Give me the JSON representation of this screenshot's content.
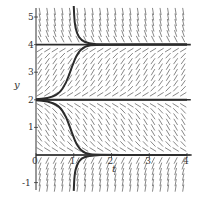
{
  "chart_data": {
    "type": "line",
    "subtype": "slope-field",
    "title": "",
    "xlabel": "t",
    "ylabel": "y",
    "xlim": [
      0,
      4
    ],
    "ylim": [
      -1.3,
      5.4
    ],
    "xticks": [
      "0",
      "1",
      "2",
      "3",
      "4"
    ],
    "yticks": [
      "-1",
      "1",
      "2",
      "3",
      "4",
      "5"
    ],
    "grid": false,
    "legend": null,
    "equilibria": [
      0,
      2,
      4
    ],
    "slope_field": {
      "description": "Direction field: slopes negative (steep) for y>4, positive for 2<y<4, negative for 0<y<2, steep for y<0",
      "t_step": 0.2,
      "y_step": 0.2
    },
    "series": [
      {
        "name": "solution-from-above-4",
        "points": [
          [
            1.0,
            5.4
          ],
          [
            1.02,
            4.8
          ],
          [
            1.08,
            4.4
          ],
          [
            1.2,
            4.15
          ],
          [
            1.4,
            4.04
          ],
          [
            1.7,
            4.0
          ],
          [
            4.0,
            4.0
          ]
        ]
      },
      {
        "name": "solution-2-to-4",
        "points": [
          [
            0.0,
            2.02
          ],
          [
            0.3,
            2.05
          ],
          [
            0.6,
            2.2
          ],
          [
            0.8,
            2.6
          ],
          [
            0.95,
            3.2
          ],
          [
            1.1,
            3.7
          ],
          [
            1.3,
            3.95
          ],
          [
            1.6,
            4.0
          ],
          [
            4.0,
            4.0
          ]
        ]
      },
      {
        "name": "solution-2-to-0",
        "points": [
          [
            0.0,
            1.98
          ],
          [
            0.3,
            1.95
          ],
          [
            0.6,
            1.8
          ],
          [
            0.8,
            1.4
          ],
          [
            0.95,
            0.8
          ],
          [
            1.1,
            0.3
          ],
          [
            1.3,
            0.05
          ],
          [
            1.6,
            0.0
          ],
          [
            4.0,
            0.0
          ]
        ]
      },
      {
        "name": "solution-from-below-0",
        "points": [
          [
            1.0,
            -1.3
          ],
          [
            1.02,
            -0.7
          ],
          [
            1.08,
            -0.35
          ],
          [
            1.2,
            -0.12
          ],
          [
            1.4,
            -0.03
          ],
          [
            1.7,
            0.0
          ]
        ]
      },
      {
        "name": "equilibrium-y2",
        "points": [
          [
            0,
            2
          ],
          [
            4,
            2
          ]
        ]
      }
    ]
  },
  "axes": {
    "x_label": "t",
    "y_label": "y",
    "x_tick_labels": [
      "0",
      "1",
      "2",
      "3",
      "4"
    ],
    "y_tick_labels": [
      "5",
      "4",
      "3",
      "2",
      "1",
      "-1"
    ]
  },
  "colors": {
    "curve": "#2b2b2b",
    "field": "#555555",
    "axis": "#333333"
  }
}
